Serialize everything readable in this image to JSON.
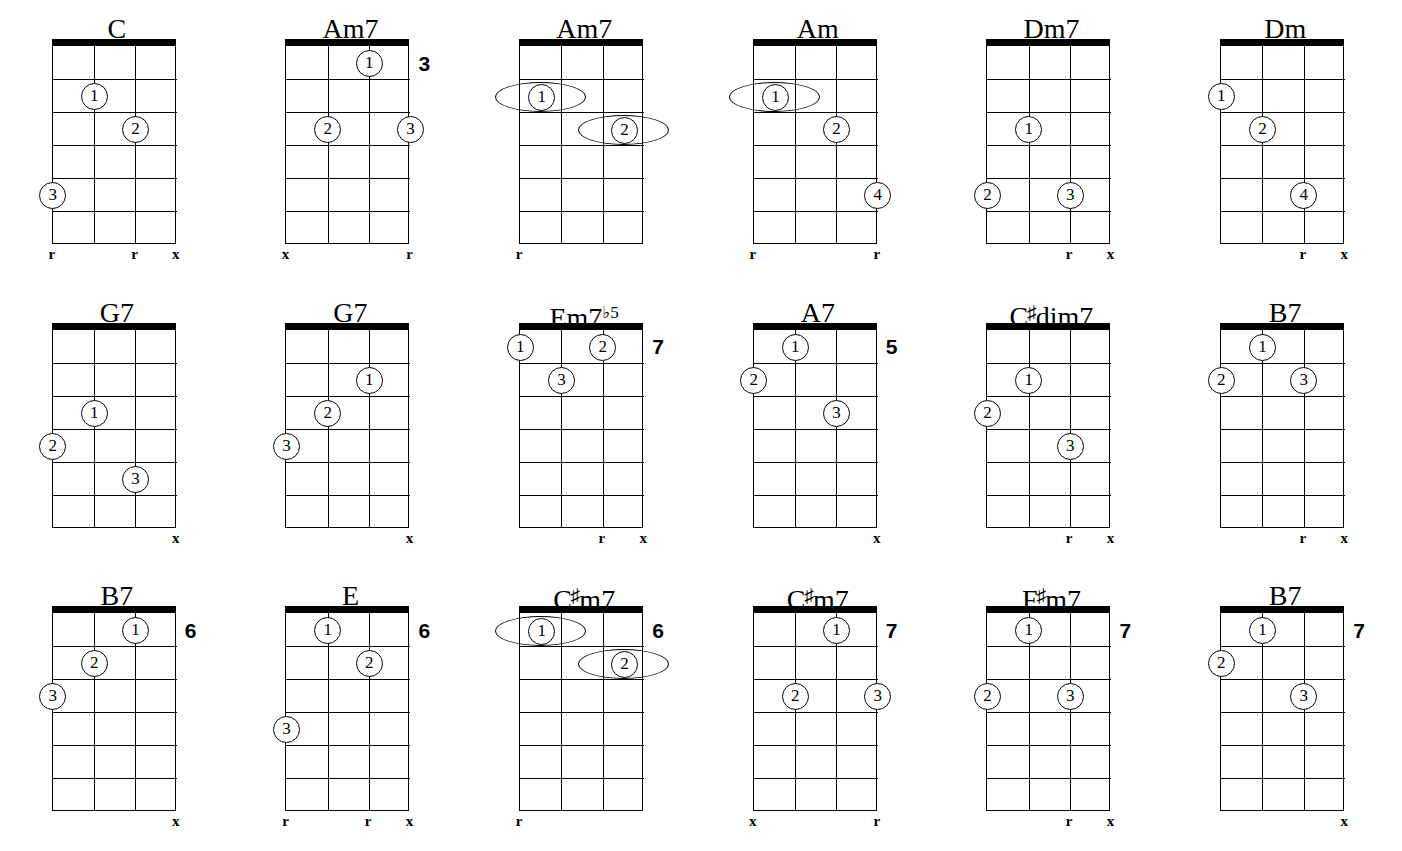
{
  "page": {
    "columns": 6,
    "rows": 3,
    "strings": 4,
    "frets": 6,
    "ink_color": "#000000",
    "paper_color": "#ffffff"
  },
  "legend": {
    "root_marker": "r",
    "mute_marker": "x",
    "finger_numbers": [
      "1",
      "2",
      "3",
      "4"
    ]
  },
  "chords": [
    {
      "name": "C",
      "name_parts": {
        "base": "C",
        "accidental": "",
        "sup": ""
      },
      "start_fret": "",
      "fingers": [
        {
          "num": "1",
          "string": 2,
          "fret": 2
        },
        {
          "num": "2",
          "string": 3,
          "fret": 3
        },
        {
          "num": "3",
          "string": 1,
          "fret": 5
        }
      ],
      "barres": [],
      "markers": [
        {
          "string": 1,
          "symbol": "r"
        },
        {
          "string": 3,
          "symbol": "r"
        },
        {
          "string": 4,
          "symbol": "x"
        }
      ]
    },
    {
      "name": "Am7",
      "name_parts": {
        "base": "Am7",
        "accidental": "",
        "sup": ""
      },
      "start_fret": "3",
      "fingers": [
        {
          "num": "1",
          "string": 3,
          "fret": 1
        },
        {
          "num": "2",
          "string": 2,
          "fret": 3
        },
        {
          "num": "3",
          "string": 4,
          "fret": 3
        }
      ],
      "barres": [],
      "markers": [
        {
          "string": 1,
          "symbol": "x"
        },
        {
          "string": 4,
          "symbol": "r"
        }
      ]
    },
    {
      "name": "Am7",
      "name_parts": {
        "base": "Am7",
        "accidental": "",
        "sup": ""
      },
      "start_fret": "",
      "fingers": [],
      "barres": [
        {
          "num": "1",
          "from_string": 1,
          "to_string": 2,
          "fret": 2
        },
        {
          "num": "2",
          "from_string": 3,
          "to_string": 4,
          "fret": 3
        }
      ],
      "markers": [
        {
          "string": 1,
          "symbol": "r"
        }
      ]
    },
    {
      "name": "Am",
      "name_parts": {
        "base": "Am",
        "accidental": "",
        "sup": ""
      },
      "start_fret": "",
      "fingers": [
        {
          "num": "2",
          "string": 3,
          "fret": 3
        },
        {
          "num": "4",
          "string": 4,
          "fret": 5
        }
      ],
      "barres": [
        {
          "num": "1",
          "from_string": 1,
          "to_string": 2,
          "fret": 2
        }
      ],
      "markers": [
        {
          "string": 1,
          "symbol": "r"
        },
        {
          "string": 4,
          "symbol": "r"
        }
      ]
    },
    {
      "name": "Dm7",
      "name_parts": {
        "base": "Dm7",
        "accidental": "",
        "sup": ""
      },
      "start_fret": "",
      "fingers": [
        {
          "num": "1",
          "string": 2,
          "fret": 3
        },
        {
          "num": "2",
          "string": 1,
          "fret": 5
        },
        {
          "num": "3",
          "string": 3,
          "fret": 5
        }
      ],
      "barres": [],
      "markers": [
        {
          "string": 3,
          "symbol": "r"
        },
        {
          "string": 4,
          "symbol": "x"
        }
      ]
    },
    {
      "name": "Dm",
      "name_parts": {
        "base": "Dm",
        "accidental": "",
        "sup": ""
      },
      "start_fret": "",
      "fingers": [
        {
          "num": "1",
          "string": 1,
          "fret": 2
        },
        {
          "num": "2",
          "string": 2,
          "fret": 3
        },
        {
          "num": "4",
          "string": 3,
          "fret": 5
        }
      ],
      "barres": [],
      "markers": [
        {
          "string": 3,
          "symbol": "r"
        },
        {
          "string": 4,
          "symbol": "x"
        }
      ]
    },
    {
      "name": "G7",
      "name_parts": {
        "base": "G7",
        "accidental": "",
        "sup": ""
      },
      "start_fret": "",
      "fingers": [
        {
          "num": "1",
          "string": 2,
          "fret": 3
        },
        {
          "num": "2",
          "string": 1,
          "fret": 4
        },
        {
          "num": "3",
          "string": 3,
          "fret": 5
        }
      ],
      "barres": [],
      "markers": [
        {
          "string": 4,
          "symbol": "x"
        }
      ]
    },
    {
      "name": "G7",
      "name_parts": {
        "base": "G7",
        "accidental": "",
        "sup": ""
      },
      "start_fret": "",
      "fingers": [
        {
          "num": "1",
          "string": 3,
          "fret": 2
        },
        {
          "num": "2",
          "string": 2,
          "fret": 3
        },
        {
          "num": "3",
          "string": 1,
          "fret": 4
        }
      ],
      "barres": [],
      "markers": [
        {
          "string": 4,
          "symbol": "x"
        }
      ]
    },
    {
      "name": "Em7b5",
      "name_parts": {
        "base": "Em7",
        "accidental": "",
        "sup": "♭5"
      },
      "start_fret": "7",
      "fingers": [
        {
          "num": "1",
          "string": 1,
          "fret": 1
        },
        {
          "num": "2",
          "string": 3,
          "fret": 1
        },
        {
          "num": "3",
          "string": 2,
          "fret": 2
        }
      ],
      "barres": [],
      "markers": [
        {
          "string": 3,
          "symbol": "r"
        },
        {
          "string": 4,
          "symbol": "x"
        }
      ]
    },
    {
      "name": "A7",
      "name_parts": {
        "base": "A7",
        "accidental": "",
        "sup": ""
      },
      "start_fret": "5",
      "fingers": [
        {
          "num": "1",
          "string": 2,
          "fret": 1
        },
        {
          "num": "2",
          "string": 1,
          "fret": 2
        },
        {
          "num": "3",
          "string": 3,
          "fret": 3
        }
      ],
      "barres": [],
      "markers": [
        {
          "string": 4,
          "symbol": "x"
        }
      ]
    },
    {
      "name": "C#dim7",
      "name_parts": {
        "base": "C",
        "accidental": "♯",
        "tail": "dim7",
        "sup": ""
      },
      "start_fret": "",
      "fingers": [
        {
          "num": "1",
          "string": 2,
          "fret": 2
        },
        {
          "num": "2",
          "string": 1,
          "fret": 3
        },
        {
          "num": "3",
          "string": 3,
          "fret": 4
        }
      ],
      "barres": [],
      "markers": [
        {
          "string": 3,
          "symbol": "r"
        },
        {
          "string": 4,
          "symbol": "x"
        }
      ]
    },
    {
      "name": "B7",
      "name_parts": {
        "base": "B7",
        "accidental": "",
        "sup": ""
      },
      "start_fret": "",
      "fingers": [
        {
          "num": "1",
          "string": 2,
          "fret": 1
        },
        {
          "num": "2",
          "string": 1,
          "fret": 2
        },
        {
          "num": "3",
          "string": 3,
          "fret": 2
        }
      ],
      "barres": [],
      "markers": [
        {
          "string": 3,
          "symbol": "r"
        },
        {
          "string": 4,
          "symbol": "x"
        }
      ]
    },
    {
      "name": "B7",
      "name_parts": {
        "base": "B7",
        "accidental": "",
        "sup": ""
      },
      "start_fret": "6",
      "fingers": [
        {
          "num": "1",
          "string": 3,
          "fret": 1
        },
        {
          "num": "2",
          "string": 2,
          "fret": 2
        },
        {
          "num": "3",
          "string": 1,
          "fret": 3
        }
      ],
      "barres": [],
      "markers": [
        {
          "string": 4,
          "symbol": "x"
        }
      ]
    },
    {
      "name": "E",
      "name_parts": {
        "base": "E",
        "accidental": "",
        "sup": ""
      },
      "start_fret": "6",
      "fingers": [
        {
          "num": "1",
          "string": 2,
          "fret": 1
        },
        {
          "num": "2",
          "string": 3,
          "fret": 2
        },
        {
          "num": "3",
          "string": 1,
          "fret": 4
        }
      ],
      "barres": [],
      "markers": [
        {
          "string": 1,
          "symbol": "r"
        },
        {
          "string": 3,
          "symbol": "r"
        },
        {
          "string": 4,
          "symbol": "x"
        }
      ]
    },
    {
      "name": "C#m7",
      "name_parts": {
        "base": "C",
        "accidental": "♯",
        "tail": "m7",
        "sup": ""
      },
      "start_fret": "6",
      "fingers": [],
      "barres": [
        {
          "num": "1",
          "from_string": 1,
          "to_string": 2,
          "fret": 1
        },
        {
          "num": "2",
          "from_string": 3,
          "to_string": 4,
          "fret": 2
        }
      ],
      "markers": [
        {
          "string": 1,
          "symbol": "r"
        }
      ]
    },
    {
      "name": "C#m7",
      "name_parts": {
        "base": "C",
        "accidental": "♯",
        "tail": "m7",
        "sup": ""
      },
      "start_fret": "7",
      "fingers": [
        {
          "num": "1",
          "string": 3,
          "fret": 1
        },
        {
          "num": "2",
          "string": 2,
          "fret": 3
        },
        {
          "num": "3",
          "string": 4,
          "fret": 3
        }
      ],
      "barres": [],
      "markers": [
        {
          "string": 1,
          "symbol": "x"
        },
        {
          "string": 4,
          "symbol": "r"
        }
      ]
    },
    {
      "name": "F#m7",
      "name_parts": {
        "base": "F",
        "accidental": "♯",
        "tail": "m7",
        "sup": ""
      },
      "start_fret": "7",
      "fingers": [
        {
          "num": "1",
          "string": 2,
          "fret": 1
        },
        {
          "num": "2",
          "string": 1,
          "fret": 3
        },
        {
          "num": "3",
          "string": 3,
          "fret": 3
        }
      ],
      "barres": [],
      "markers": [
        {
          "string": 3,
          "symbol": "r"
        },
        {
          "string": 4,
          "symbol": "x"
        }
      ]
    },
    {
      "name": "B7",
      "name_parts": {
        "base": "B7",
        "accidental": "",
        "sup": ""
      },
      "start_fret": "7",
      "fingers": [
        {
          "num": "1",
          "string": 2,
          "fret": 1
        },
        {
          "num": "2",
          "string": 1,
          "fret": 2
        },
        {
          "num": "3",
          "string": 3,
          "fret": 3
        }
      ],
      "barres": [],
      "markers": [
        {
          "string": 4,
          "symbol": "x"
        }
      ]
    }
  ]
}
